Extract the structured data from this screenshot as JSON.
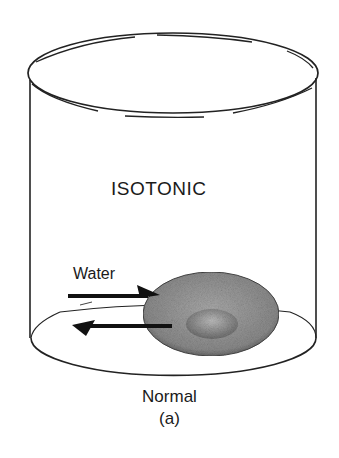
{
  "diagram": {
    "title": "ISOTONIC",
    "arrow_label": "Water",
    "caption": "Normal",
    "panel_label": "(a)",
    "elements": [
      "beaker",
      "red-blood-cell",
      "water-in-arrow",
      "water-out-arrow"
    ]
  }
}
